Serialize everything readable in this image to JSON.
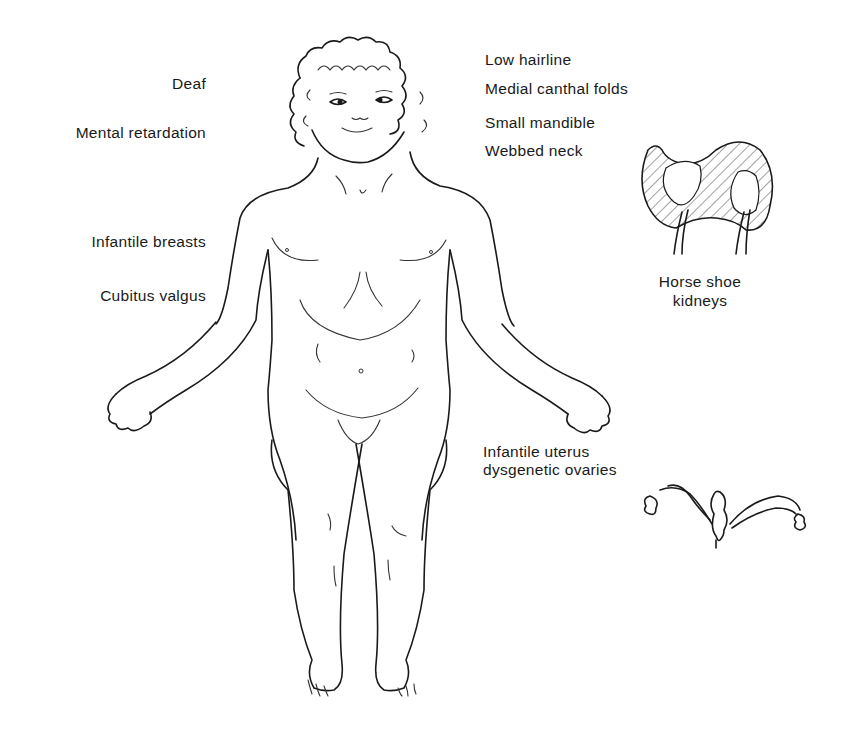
{
  "figure": {
    "left_labels": [
      {
        "id": "deaf",
        "text": "Deaf"
      },
      {
        "id": "mental-retardation",
        "text": "Mental retardation"
      },
      {
        "id": "infantile-breasts",
        "text": "Infantile breasts"
      },
      {
        "id": "cubitus-valgus",
        "text": "Cubitus valgus"
      }
    ],
    "right_labels": [
      {
        "id": "low-hairline",
        "text": "Low hairline"
      },
      {
        "id": "medial-canthal-folds",
        "text": "Medial canthal folds"
      },
      {
        "id": "small-mandible",
        "text": "Small mandible"
      },
      {
        "id": "webbed-neck",
        "text": "Webbed neck"
      }
    ],
    "insets": {
      "kidneys": {
        "line1": "Horse shoe",
        "line2": "kidneys"
      },
      "uterus": {
        "line1": "Infantile uterus",
        "line2": "dysgenetic ovaries"
      }
    }
  }
}
